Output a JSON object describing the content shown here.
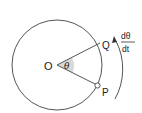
{
  "diagram": {
    "type": "circular-motion",
    "center_label": "O",
    "angle_label": "θ",
    "point_q_label": "Q",
    "point_p_label": "P",
    "rate": {
      "numerator": "dθ",
      "denominator": "dt"
    },
    "arrow_direction": "counterclockwise"
  },
  "colors": {
    "stroke": "#555555",
    "text": "#222222",
    "angle_fill": "#d9d9d9",
    "background": "#ffffff"
  }
}
